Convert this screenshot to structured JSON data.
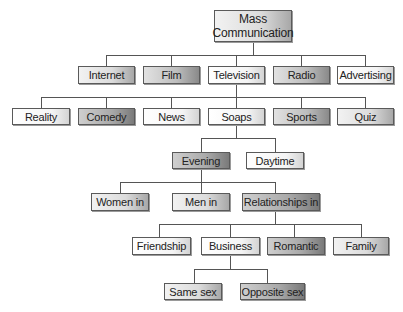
{
  "diagram": {
    "line_color": "#555555",
    "root": {
      "label_line1": "Mass",
      "label_line2": "Communication"
    },
    "level1": [
      {
        "label": "Internet"
      },
      {
        "label": "Film"
      },
      {
        "label": "Television"
      },
      {
        "label": "Radio"
      },
      {
        "label": "Advertising"
      }
    ],
    "television_genres": [
      {
        "label": "Reality"
      },
      {
        "label": "Comedy"
      },
      {
        "label": "News"
      },
      {
        "label": "Soaps"
      },
      {
        "label": "Sports"
      },
      {
        "label": "Quiz"
      }
    ],
    "soap_types": [
      {
        "label": "Evening"
      },
      {
        "label": "Daytime"
      }
    ],
    "evening_topics": [
      {
        "label": "Women in"
      },
      {
        "label": "Men in"
      },
      {
        "label": "Relationships in"
      }
    ],
    "relationship_types": [
      {
        "label": "Friendship"
      },
      {
        "label": "Business"
      },
      {
        "label": "Romantic"
      },
      {
        "label": "Family"
      }
    ],
    "business_types": [
      {
        "label": "Same sex"
      },
      {
        "label": "Opposite sex"
      }
    ]
  }
}
